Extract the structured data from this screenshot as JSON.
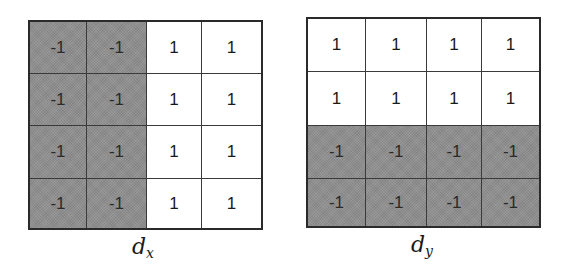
{
  "colors": {
    "negative_fill": "#8f8f8f",
    "positive_fill": "#ffffff",
    "border": "#2a2a2a"
  },
  "kernels": [
    {
      "name": "dx",
      "caption_base": "d",
      "caption_sub": "x",
      "rows": [
        [
          "-1",
          "-1",
          "1",
          "1"
        ],
        [
          "-1",
          "-1",
          "1",
          "1"
        ],
        [
          "-1",
          "-1",
          "1",
          "1"
        ],
        [
          "-1",
          "-1",
          "1",
          "1"
        ]
      ]
    },
    {
      "name": "dy",
      "caption_base": "d",
      "caption_sub": "y",
      "rows": [
        [
          "1",
          "1",
          "1",
          "1"
        ],
        [
          "1",
          "1",
          "1",
          "1"
        ],
        [
          "-1",
          "-1",
          "-1",
          "-1"
        ],
        [
          "-1",
          "-1",
          "-1",
          "-1"
        ]
      ]
    }
  ]
}
